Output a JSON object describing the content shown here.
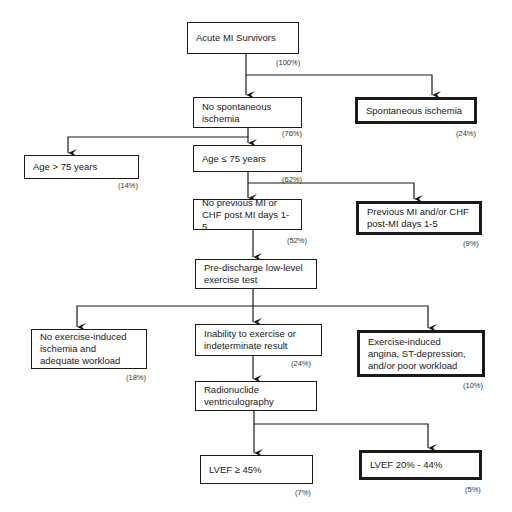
{
  "flowchart": {
    "nodes": [
      {
        "id": "survivors",
        "label": "Acute MI Survivors",
        "pct": "(100%)"
      },
      {
        "id": "no_spont",
        "label": "No spontaneous ischemia",
        "pct": "(76%)"
      },
      {
        "id": "spont",
        "label": "Spontaneous ischemia",
        "pct": "(24%)"
      },
      {
        "id": "age_gt",
        "label": "Age > 75 years",
        "pct": "(14%)"
      },
      {
        "id": "age_le",
        "label": "Age ≤ 75 years",
        "pct": "(62%)"
      },
      {
        "id": "no_prev",
        "label": "No previous MI or CHF post MI days 1-5",
        "pct": "(52%)"
      },
      {
        "id": "prev",
        "label": "Previous MI and/or CHF post-MI days 1-5",
        "pct": "(9%)"
      },
      {
        "id": "predischarge",
        "label": "Pre-discharge low-level exercise test"
      },
      {
        "id": "no_ex_isch",
        "label": "No exercise-induced ischemia and adequate workload",
        "pct": "(18%)"
      },
      {
        "id": "inability",
        "label": "Inability to exercise or indeterminate result",
        "pct": "(24%)"
      },
      {
        "id": "ex_angina",
        "label": "Exercise-induced angina, ST-depression, and/or poor workload",
        "pct": "(10%)"
      },
      {
        "id": "rnv",
        "label": "Radionuclide ventriculography"
      },
      {
        "id": "lvef_ge45",
        "label": "LVEF ≥ 45%",
        "pct": "(7%)"
      },
      {
        "id": "lvef_20_44",
        "label": "LVEF 20% - 44%",
        "pct": "(5%)"
      }
    ]
  }
}
